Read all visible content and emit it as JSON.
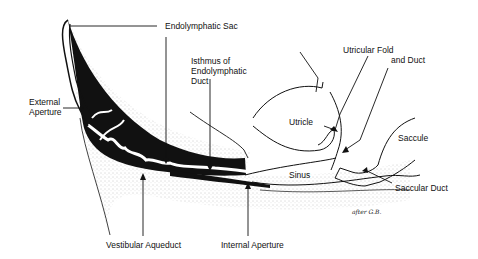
{
  "diagram": {
    "labels": {
      "endolymphatic_sac": "Endolymphatic Sac",
      "isthmus_line1": "Isthmus of",
      "isthmus_line2": "Endolymphatic",
      "isthmus_line3": "Duct",
      "external_aperture_line1": "External",
      "external_aperture_line2": "Aperture",
      "utricular_fold_line1": "Utricular Fold",
      "utricular_fold_line2": "and Duct",
      "utricle": "Utricle",
      "saccule": "Saccule",
      "sinus": "Sinus",
      "saccular_duct": "Saccular Duct",
      "vestibular_aqueduct": "Vestibular Aqueduct",
      "internal_aperture": "Internal Aperture"
    },
    "signature": "after G.B.",
    "colors": {
      "ink": "#111111",
      "background": "#ffffff",
      "stipple": "#9a9a9a"
    }
  }
}
